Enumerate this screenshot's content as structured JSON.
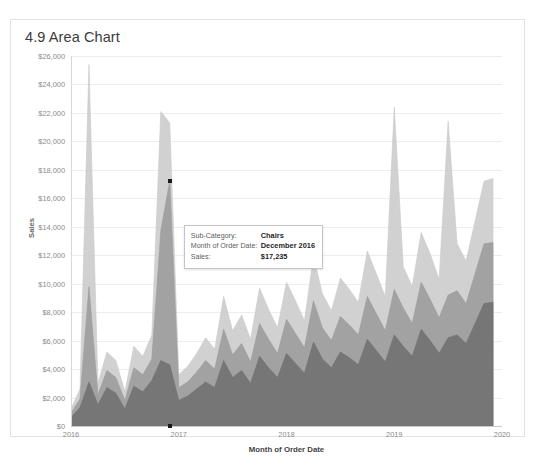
{
  "card": {
    "title": "4.9 Area Chart"
  },
  "tooltip": {
    "rows": [
      {
        "key": "Sub-Category:",
        "value": "Chairs"
      },
      {
        "key": "Month of Order Date:",
        "value": "December 2016"
      },
      {
        "key": "Sales:",
        "value": "$17,235"
      }
    ]
  },
  "chart_data": {
    "type": "area",
    "title": "4.9 Area Chart",
    "xlabel": "Month of Order Date",
    "ylabel": "Sales",
    "ylim": [
      0,
      26000
    ],
    "ytick_labels": [
      "$0",
      "$2,000",
      "$4,000",
      "$6,000",
      "$8,000",
      "$10,000",
      "$12,000",
      "$14,000",
      "$16,000",
      "$18,000",
      "$20,000",
      "$22,000",
      "$24,000",
      "$26,000"
    ],
    "ytick_values": [
      0,
      2000,
      4000,
      6000,
      8000,
      10000,
      12000,
      14000,
      16000,
      18000,
      20000,
      22000,
      24000,
      26000
    ],
    "xtick_labels": [
      "2016",
      "2017",
      "2018",
      "2019",
      "2020"
    ],
    "xtick_values": [
      0,
      12,
      24,
      36,
      48
    ],
    "grid": true,
    "legend": "none",
    "overlap_mode": "overlapping-translucent",
    "colors": {
      "series_dark": "#6f6f6f",
      "series_mid": "#9a9a9a",
      "series_light": "#c9c9c9",
      "grid": "#ededed",
      "axis": "#c9c9c9",
      "marker": "#1a1a1a"
    },
    "x_months": [
      "2016-01",
      "2016-02",
      "2016-03",
      "2016-04",
      "2016-05",
      "2016-06",
      "2016-07",
      "2016-08",
      "2016-09",
      "2016-10",
      "2016-11",
      "2016-12",
      "2017-01",
      "2017-02",
      "2017-03",
      "2017-04",
      "2017-05",
      "2017-06",
      "2017-07",
      "2017-08",
      "2017-09",
      "2017-10",
      "2017-11",
      "2017-12",
      "2018-01",
      "2018-02",
      "2018-03",
      "2018-04",
      "2018-05",
      "2018-06",
      "2018-07",
      "2018-08",
      "2018-09",
      "2018-10",
      "2018-11",
      "2018-12",
      "2019-01",
      "2019-02",
      "2019-03",
      "2019-04",
      "2019-05",
      "2019-06",
      "2019-07",
      "2019-08",
      "2019-09",
      "2019-10",
      "2019-11",
      "2019-12"
    ],
    "series": [
      {
        "name": "series-light",
        "color": "#c9c9c9",
        "values": [
          1200,
          2600,
          25400,
          3000,
          5200,
          4600,
          2400,
          5600,
          4900,
          6400,
          22100,
          21300,
          3600,
          4200,
          5100,
          6200,
          5400,
          9100,
          6700,
          7800,
          6100,
          9700,
          8200,
          6900,
          10100,
          8800,
          7400,
          11900,
          9300,
          8100,
          10400,
          9600,
          8700,
          12300,
          10700,
          9100,
          22400,
          11200,
          9800,
          13600,
          12100,
          10300,
          21400,
          12800,
          11600,
          14400,
          17200,
          17400
        ]
      },
      {
        "name": "series-mid",
        "color": "#9a9a9a",
        "values": [
          900,
          1900,
          9800,
          2200,
          3900,
          3400,
          1800,
          4100,
          3600,
          4700,
          13700,
          17235,
          2700,
          3100,
          3800,
          4600,
          4000,
          6800,
          5000,
          5800,
          4500,
          7200,
          6100,
          5100,
          7500,
          6500,
          5500,
          8800,
          6900,
          6000,
          7700,
          7100,
          6400,
          9100,
          7900,
          6700,
          9600,
          8300,
          7200,
          10100,
          8900,
          7600,
          9200,
          9500,
          8600,
          10700,
          12800,
          12900
        ]
      },
      {
        "name": "series-dark",
        "color": "#6f6f6f",
        "values": [
          600,
          1300,
          3100,
          1500,
          2700,
          2300,
          1200,
          2800,
          2400,
          3200,
          4600,
          4300,
          1800,
          2100,
          2600,
          3100,
          2700,
          4600,
          3400,
          3900,
          3000,
          4900,
          4100,
          3400,
          5100,
          4400,
          3700,
          5900,
          4700,
          4100,
          5200,
          4800,
          4300,
          6100,
          5300,
          4500,
          6400,
          5600,
          4900,
          6800,
          6000,
          5100,
          6200,
          6400,
          5800,
          7200,
          8600,
          8700
        ]
      }
    ],
    "highlight_point": {
      "series": "Chairs",
      "x": "2016-12",
      "x_index": 11,
      "y": 17235,
      "label": "$17,235"
    }
  }
}
